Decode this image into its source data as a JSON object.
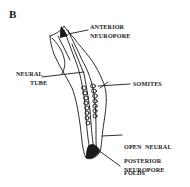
{
  "figure": {
    "panel_letter": "B",
    "labels": {
      "anterior_neuropore": [
        "ANTERIOR",
        "NEUROPORE"
      ],
      "neural_tube": [
        "NEURAL",
        "TUBE"
      ],
      "somites": [
        "SOMITES"
      ],
      "open_neural_folds": [
        "OPEN  NEURAL",
        "FOLDS"
      ],
      "posterior_neuropore": [
        "POSTERIOR",
        "NEUROPORE"
      ]
    },
    "colors": {
      "ink": "#1a1a1a",
      "background": "#ffffff"
    }
  }
}
